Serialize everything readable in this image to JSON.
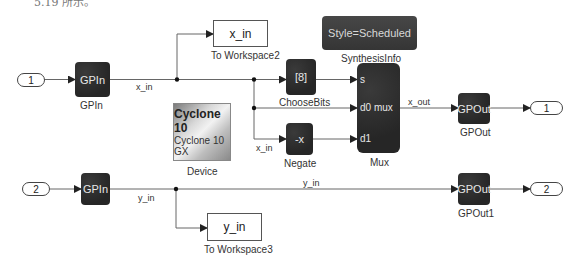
{
  "caption_fragment": "5.19 所示。",
  "colors": {
    "block_fill": "#2b2b2b",
    "block_text": "#e8e8e8",
    "wire": "#555555",
    "background": "#ffffff"
  },
  "blocks": {
    "inport1": {
      "label": "1"
    },
    "inport2": {
      "label": "2"
    },
    "gpin_top": {
      "text": "GPIn",
      "name": "GPIn"
    },
    "gpin_bottom": {
      "text": "GPIn"
    },
    "to_workspace2": {
      "text": "x_in",
      "name": "To Workspace2"
    },
    "to_workspace3": {
      "text": "y_in",
      "name": "To Workspace3"
    },
    "synthesis_info": {
      "text": "Style=Scheduled",
      "name": "SynthesisInfo"
    },
    "choose_bits": {
      "text": "[8]",
      "name": "ChooseBits"
    },
    "negate": {
      "text": "-x",
      "name": "Negate"
    },
    "mux": {
      "name": "Mux",
      "ports": {
        "s": "s",
        "d0": "d0 mux",
        "d1": "d1"
      }
    },
    "device": {
      "line1": "Cyclone 10",
      "line2": "Cyclone 10 GX",
      "name": "Device"
    },
    "gpout_top": {
      "text": "GPOut",
      "name": "GPOut"
    },
    "gpout_bottom": {
      "text": "GPOut",
      "name": "GPOut1"
    },
    "outport1": {
      "label": "1"
    },
    "outport2": {
      "label": "2"
    }
  },
  "signals": {
    "x_in_main": "x_in",
    "x_in_negate": "x_in",
    "x_out": "x_out",
    "y_in_main": "y_in",
    "y_in_long": "y_in"
  }
}
